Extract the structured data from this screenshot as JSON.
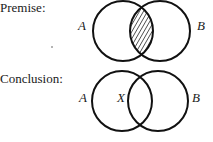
{
  "premise": {
    "heading": "Premise:",
    "left_label": "A",
    "right_label": "B",
    "shaded_region": "A∩B (intersection hatched)"
  },
  "conclusion": {
    "heading": "Conclusion:",
    "left_label": "A",
    "right_label": "B",
    "marker": "X"
  },
  "colors": {
    "stroke": "#111111",
    "background": "#ffffff"
  }
}
